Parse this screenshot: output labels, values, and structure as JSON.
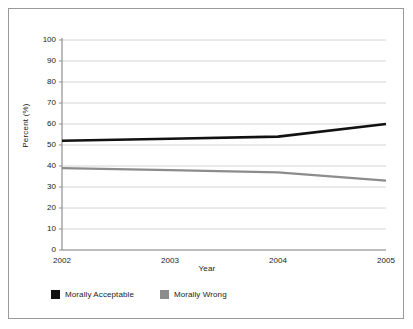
{
  "chart_data": {
    "type": "line",
    "title": "",
    "xlabel": "Year",
    "ylabel": "Percent (%)",
    "x": [
      "2002",
      "2003",
      "2004",
      "2005"
    ],
    "categories": [
      "2002",
      "2003",
      "2004",
      "2005"
    ],
    "series": [
      {
        "name": "Morally Acceptable",
        "color": "#111111",
        "values": [
          52,
          53,
          54,
          60
        ]
      },
      {
        "name": "Morally Wrong",
        "color": "#8c8c8c",
        "values": [
          39,
          38,
          37,
          33
        ]
      }
    ],
    "ylim": [
      0,
      100
    ],
    "ytick_step": 10,
    "yticks": [
      100,
      90,
      80,
      70,
      60,
      50,
      40,
      30,
      20,
      10,
      0
    ],
    "xticks": [
      "2002",
      "2003",
      "2004",
      "2005"
    ],
    "grid": "horizontal",
    "legend_position": "bottom-left",
    "legend": [
      "Morally Acceptable",
      "Morally Wrong"
    ]
  },
  "axes": {
    "y_title": "Percent (%)",
    "x_title": "Year"
  },
  "legend": {
    "items": [
      {
        "label": "Morally Acceptable",
        "color": "#111111"
      },
      {
        "label": "Morally Wrong",
        "color": "#8c8c8c"
      }
    ]
  },
  "colors": {
    "series_acceptable": "#111111",
    "series_wrong": "#8c8c8c",
    "grid": "#d4d4d4",
    "axis": "#8f8f8f",
    "frame": "#9a9a9a",
    "text": "#1a1a1a"
  }
}
